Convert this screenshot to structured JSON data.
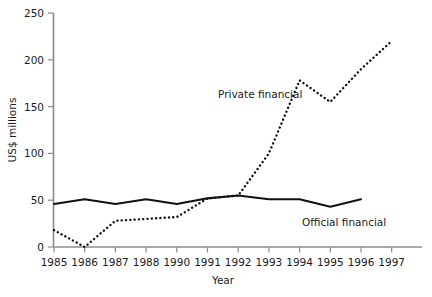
{
  "chart_data": {
    "type": "line",
    "title": "",
    "xlabel": "Year",
    "ylabel": "US$ millions",
    "x": [
      1985,
      1986,
      1987,
      1988,
      1990,
      1991,
      1992,
      1993,
      1994,
      1995,
      1996,
      1997
    ],
    "categories": [
      "1985",
      "1986",
      "1987",
      "1988",
      "1990",
      "1991",
      "1992",
      "1993",
      "1994",
      "1995",
      "1996",
      "1997"
    ],
    "xlim": [
      1985,
      1997
    ],
    "ylim": [
      0,
      250
    ],
    "yticks": [
      0,
      50,
      100,
      150,
      200,
      250
    ],
    "ytick_labels": [
      "0",
      "50",
      "100",
      "150",
      "200",
      "250"
    ],
    "xtick_labels": [
      "1985",
      "1986",
      "1987",
      "1988",
      "1990",
      "1991",
      "1992",
      "1993",
      "1994",
      "1995",
      "1996",
      "1997"
    ],
    "grid": false,
    "legend": "inline-annotations",
    "series": [
      {
        "name": "Private financial",
        "style": "dotted",
        "color": "#111111",
        "values": [
          18,
          0,
          28,
          30,
          32,
          52,
          55,
          100,
          178,
          155,
          190,
          220
        ]
      },
      {
        "name": "Official financial",
        "style": "solid",
        "color": "#111111",
        "values": [
          46,
          51,
          46,
          51,
          46,
          52,
          55,
          51,
          51,
          43,
          51,
          null
        ]
      }
    ],
    "annotations": [
      {
        "text": "Private financial",
        "near_x": 1992,
        "near_y": 163
      },
      {
        "text": "Official financial",
        "near_x": 1995,
        "near_y": 33
      }
    ]
  },
  "axes": {
    "y_axis_label": "US$ millions",
    "x_axis_label": "Year"
  }
}
